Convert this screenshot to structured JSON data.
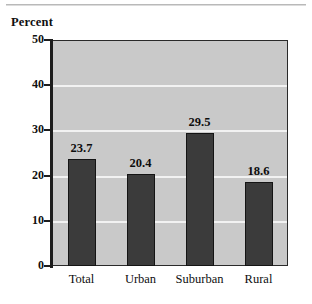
{
  "figure": {
    "axis_title": "Percent",
    "has_top_rule": true
  },
  "chart_data": {
    "type": "bar",
    "title": "",
    "xlabel": "",
    "ylabel": "Percent",
    "categories": [
      "Total",
      "Urban",
      "Suburban",
      "Rural"
    ],
    "values": [
      23.7,
      20.4,
      29.5,
      18.6
    ],
    "value_labels": [
      "23.7",
      "20.4",
      "29.5",
      "18.6"
    ],
    "ylim": [
      0,
      50
    ],
    "ytick_labels": [
      "0",
      "10",
      "20",
      "30",
      "40",
      "50"
    ],
    "ytick_values": [
      0,
      10,
      20,
      30,
      40,
      50
    ],
    "grid": true,
    "grid_axis": "y",
    "legend": false,
    "colors": {
      "bar_fill": "#3b3b3b",
      "bar_edge": "#141414",
      "plot_background": "#c9c9c9",
      "gridline": "#f2f2f2",
      "axis": "#1d1d1d",
      "text": "#0d0d0d",
      "page_background": "#ffffff"
    }
  }
}
